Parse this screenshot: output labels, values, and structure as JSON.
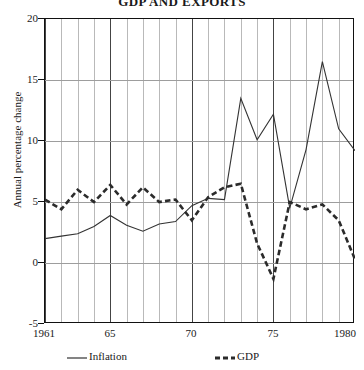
{
  "chart_data": {
    "type": "line",
    "title": "GDP AND EXPORTS",
    "xlabel": "",
    "ylabel": "Annual percentage change",
    "xlim": [
      1961,
      1980
    ],
    "ylim": [
      -5,
      20
    ],
    "yticks": [
      20,
      15,
      10,
      5,
      0,
      -5
    ],
    "ytick_labels": [
      "20",
      "15",
      "10",
      "5",
      "0",
      "-5"
    ],
    "xticks": [
      1961,
      1965,
      1970,
      1975,
      1980
    ],
    "xtick_labels": [
      "1961",
      "65",
      "70",
      "75",
      "1980"
    ],
    "grid": "vertical gridlines at every year, horizontal gridlines at each y tick",
    "legend_position": "below axes",
    "x": [
      1961,
      1962,
      1963,
      1964,
      1965,
      1966,
      1967,
      1968,
      1969,
      1970,
      1971,
      1972,
      1973,
      1974,
      1975,
      1976,
      1977,
      1978,
      1979,
      1980
    ],
    "series": [
      {
        "name": "Inflation",
        "style": "solid",
        "color": "#333333",
        "values": [
          2.0,
          2.2,
          2.4,
          3.0,
          3.9,
          3.1,
          2.6,
          3.2,
          3.4,
          4.7,
          5.3,
          5.2,
          13.5,
          10.1,
          12.2,
          4.5,
          9.3,
          16.5,
          11.0,
          9.2
        ]
      },
      {
        "name": "GDP",
        "style": "dashed",
        "color": "#2b2b2b",
        "values": [
          5.2,
          4.4,
          6.0,
          5.0,
          6.4,
          4.8,
          6.2,
          5.0,
          5.2,
          3.5,
          5.4,
          6.2,
          6.5,
          1.6,
          -1.3,
          5.0,
          4.4,
          4.8,
          3.5,
          0.3
        ]
      }
    ]
  },
  "legend": {
    "entries": [
      {
        "label": "Inflation",
        "style": "solid"
      },
      {
        "label": "GDP",
        "style": "dashed"
      }
    ]
  }
}
